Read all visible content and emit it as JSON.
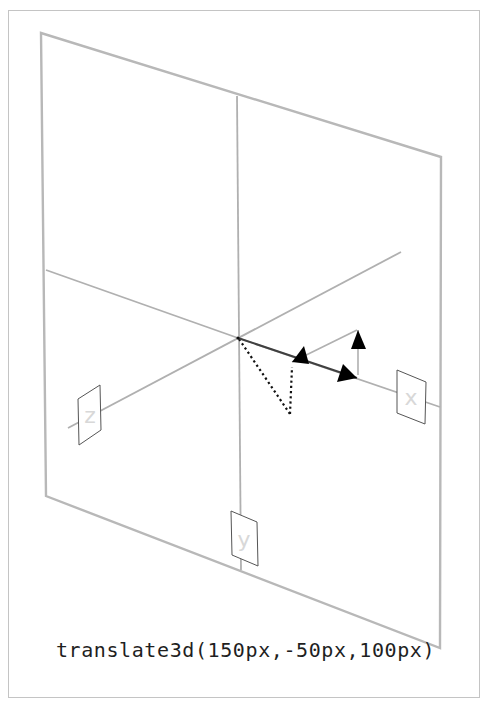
{
  "caption": "translate3d(150px,-50px,100px)",
  "transform": {
    "function": "translate3d",
    "x": "150px",
    "y": "-50px",
    "z": "100px"
  },
  "colors": {
    "frame_border": "#c4c4c4",
    "plane_stroke": "#b8b8b8",
    "axis_stroke": "#b0b0b0",
    "axis_x_dark": "#404040",
    "arrow_fill": "#000000",
    "dotted": "#111111",
    "label_text": "#d8d8d8",
    "label_box_stroke": "#555555"
  },
  "diagram": {
    "plane": {
      "points": [
        [
          41,
          33
        ],
        [
          441,
          157
        ],
        [
          440,
          648
        ],
        [
          46,
          496
        ]
      ]
    },
    "axes": {
      "vertical": {
        "x1": 237,
        "y1": 96,
        "x2": 241,
        "y2": 570
      },
      "horizontal_left": {
        "x1": 46,
        "y1": 270,
        "x2": 238,
        "y2": 338
      },
      "x_axis": {
        "x1": 238,
        "y1": 338,
        "x2": 440,
        "y2": 407
      },
      "z_axis": {
        "x1": 68,
        "y1": 428,
        "x2": 401,
        "y2": 252
      }
    },
    "labels": [
      {
        "name": "x",
        "text": "x",
        "points": [
          [
            397,
            370
          ],
          [
            426,
            382
          ],
          [
            425,
            424
          ],
          [
            397,
            413
          ]
        ],
        "tx": 411,
        "ty": 405
      },
      {
        "name": "z",
        "text": "z",
        "points": [
          [
            78,
            399
          ],
          [
            100,
            385
          ],
          [
            101,
            430
          ],
          [
            79,
            445
          ]
        ],
        "tx": 90,
        "ty": 423
      },
      {
        "name": "y",
        "text": "y",
        "points": [
          [
            231,
            511
          ],
          [
            257,
            522
          ],
          [
            258,
            566
          ],
          [
            232,
            555
          ]
        ],
        "tx": 244,
        "ty": 547
      }
    ],
    "vectors": {
      "x_move": {
        "x1": 238,
        "y1": 338,
        "x2": 357,
        "y2": 378,
        "head": [
          [
            357,
            378
          ],
          [
            343,
            364
          ],
          [
            337,
            382
          ]
        ]
      },
      "z_move": {
        "x1": 357,
        "y1": 330,
        "x2": 292,
        "y2": 362,
        "head": [
          [
            292,
            362
          ],
          [
            304,
            346
          ],
          [
            309,
            364
          ]
        ]
      },
      "y_move": {
        "x1": 358,
        "y1": 375,
        "x2": 358,
        "y2": 330,
        "head": [
          [
            358,
            330
          ],
          [
            351,
            349
          ],
          [
            366,
            349
          ]
        ]
      },
      "dotted_1": {
        "x1": 239,
        "y1": 339,
        "x2": 290,
        "y2": 414
      },
      "dotted_2": {
        "x1": 290,
        "y1": 414,
        "x2": 292,
        "y2": 367
      }
    }
  }
}
